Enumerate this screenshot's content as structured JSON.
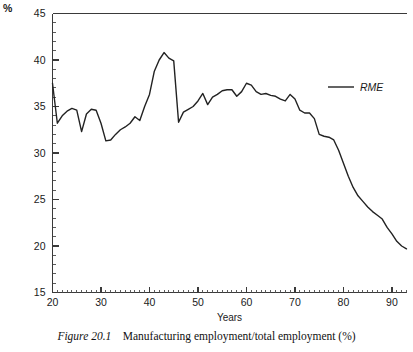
{
  "figure": {
    "caption_label": "Figure 20.1",
    "caption_text": "Manufacturing employment/total employment (%)"
  },
  "chart_data": {
    "type": "line",
    "title": "",
    "subtitle": "",
    "xlabel": "Years",
    "ylabel": "",
    "unit_label": "%",
    "xlim": [
      20,
      93
    ],
    "ylim": [
      15,
      45
    ],
    "grid": false,
    "legend_position": "top-right",
    "x_major_ticks": [
      20,
      30,
      40,
      50,
      60,
      70,
      80,
      90
    ],
    "x_tick_labels": [
      "20",
      "30",
      "40",
      "50",
      "60",
      "70",
      "80",
      "90"
    ],
    "x_minor_tick_step": 1,
    "y_major_ticks": [
      15,
      20,
      25,
      30,
      35,
      40,
      45
    ],
    "y_tick_labels": [
      "15",
      "20",
      "25",
      "30",
      "35",
      "40",
      "45"
    ],
    "y_minor_tick_step": 1,
    "series": [
      {
        "name": "RME",
        "color": "#222222",
        "x": [
          20,
          21,
          22,
          23,
          24,
          25,
          26,
          27,
          28,
          29,
          30,
          31,
          32,
          33,
          34,
          35,
          36,
          37,
          38,
          39,
          40,
          41,
          42,
          43,
          44,
          45,
          46,
          47,
          48,
          49,
          50,
          51,
          52,
          53,
          54,
          55,
          56,
          57,
          58,
          59,
          60,
          61,
          62,
          63,
          64,
          65,
          66,
          67,
          68,
          69,
          70,
          71,
          72,
          73,
          74,
          75,
          76,
          77,
          78,
          79,
          80,
          81,
          82,
          83,
          84,
          85,
          86,
          87,
          88,
          89,
          90,
          91,
          92,
          93
        ],
        "values": [
          37.5,
          33.2,
          34.0,
          34.5,
          34.8,
          34.6,
          32.3,
          34.2,
          34.7,
          34.6,
          33.2,
          31.3,
          31.4,
          32.0,
          32.5,
          32.8,
          33.2,
          33.9,
          33.5,
          35.0,
          36.3,
          38.8,
          40.0,
          40.8,
          40.2,
          39.9,
          33.3,
          34.4,
          34.7,
          35.0,
          35.6,
          36.4,
          35.2,
          36.0,
          36.3,
          36.7,
          36.8,
          36.8,
          36.1,
          36.6,
          37.5,
          37.3,
          36.6,
          36.3,
          36.4,
          36.2,
          36.1,
          35.8,
          35.6,
          36.3,
          35.8,
          34.6,
          34.3,
          34.3,
          33.7,
          32.0,
          31.8,
          31.7,
          31.4,
          30.3,
          28.9,
          27.5,
          26.3,
          25.4,
          24.8,
          24.2,
          23.7,
          23.3,
          22.9,
          22.0,
          21.3,
          20.5,
          20.0,
          19.7
        ]
      }
    ],
    "legend": [
      {
        "label": "RME",
        "color": "#222222"
      }
    ]
  }
}
